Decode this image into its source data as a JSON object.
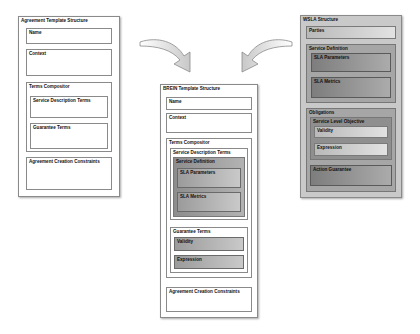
{
  "left": {
    "title": "Agreement Template Structure",
    "name": "Name",
    "context": "Context",
    "terms": "Terms Compositor",
    "sdt": "Service Description Terms",
    "gt": "Guarantee Terms",
    "acc": "Agreement Creation Constraints"
  },
  "middle": {
    "title": "BREIN Template Structure",
    "name": "Name",
    "context": "Context",
    "terms": "Terms Compositor",
    "sdt": "Service Description Terms",
    "sd": "Service Definition",
    "slap": "SLA Parameters",
    "slam": "SLA Metrics",
    "gt": "Guarantee Terms",
    "validity": "Validity",
    "expression": "Expression",
    "acc": "Agreement Creation Constraints"
  },
  "right": {
    "title": "WSLA Structure",
    "parties": "Parties",
    "sd": "Service Definition",
    "slap": "SLA Parameters",
    "slam": "SLA Metrics",
    "obligations": "Obligations",
    "slo": "Service Level Objective",
    "validity": "Validity",
    "expression": "Expression",
    "ag": "Action Guarantee"
  },
  "colors": {
    "white": "#ffffff",
    "border": "#8a8a8a",
    "gray_frame": "#9a9a9a"
  }
}
